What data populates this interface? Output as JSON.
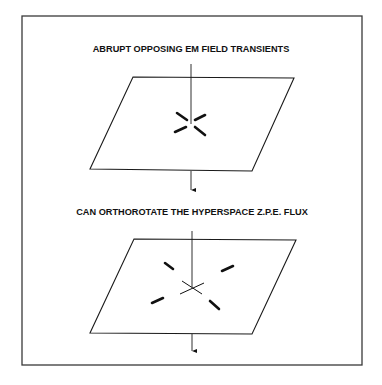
{
  "figure": {
    "panels": [
      {
        "id": "panel-top",
        "title": "ABRUPT OPPOSING EM FIELD TRANSIENTS",
        "marks": "four short thick dashes converging close to the central axis",
        "axis": "vertical line passing through plane with downward arrow below"
      },
      {
        "id": "panel-bottom",
        "title": "CAN ORTHOROTATE THE HYPERSPACE Z.P.E. FLUX",
        "marks": "four thick dashes spread outward diagonally plus thin crossing lines at center",
        "axis": "vertical line passing through plane with downward arrow below"
      }
    ],
    "colors": {
      "ink": "#111111",
      "frame": "#3a3a3a",
      "background": "#ffffff"
    }
  }
}
